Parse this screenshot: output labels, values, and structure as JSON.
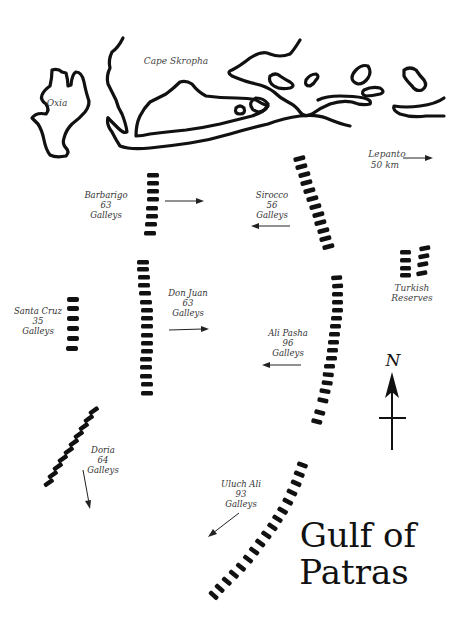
{
  "map": {
    "title_line1": "Gulf of",
    "title_line2": "Patras",
    "places": {
      "oxia": "Oxia",
      "cape": "Cape Skropha",
      "lepanto_line1": "Lepanto",
      "lepanto_line2": "50 km",
      "turkish_line1": "Turkish",
      "turkish_line2": "Reserves"
    },
    "compass": {
      "label": "N"
    },
    "fleets": [
      {
        "id": "barbarigo",
        "name": "Barbarigo",
        "count": "63",
        "unit": "Galleys",
        "side": "Holy League",
        "direction": "east"
      },
      {
        "id": "sirocco",
        "name": "Sirocco",
        "count": "56",
        "unit": "Galleys",
        "side": "Ottoman",
        "direction": "west"
      },
      {
        "id": "don-juan",
        "name": "Don Juan",
        "count": "63",
        "unit": "Galleys",
        "side": "Holy League",
        "direction": "east"
      },
      {
        "id": "santa-cruz",
        "name": "Santa Cruz",
        "count": "35",
        "unit": "Galleys",
        "side": "Holy League",
        "direction": "none"
      },
      {
        "id": "ali-pasha",
        "name": "Ali Pasha",
        "count": "96",
        "unit": "Galleys",
        "side": "Ottoman",
        "direction": "west"
      },
      {
        "id": "doria",
        "name": "Doria",
        "count": "64",
        "unit": "Galleys",
        "side": "Holy League",
        "direction": "south"
      },
      {
        "id": "uluch-ali",
        "name": "Uluch Ali",
        "count": "93",
        "unit": "Galleys",
        "side": "Ottoman",
        "direction": "southwest"
      }
    ]
  }
}
